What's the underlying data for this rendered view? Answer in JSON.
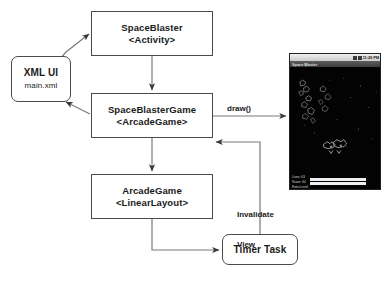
{
  "diagram": {
    "nodes": [
      {
        "id": "spaceblaster",
        "line1": "SpaceBlaster",
        "line2": "<Activity>",
        "shape": "rect"
      },
      {
        "id": "xmlui",
        "line1": "XML UI",
        "line2": "main.xml",
        "shape": "rounded-rect"
      },
      {
        "id": "game",
        "line1": "SpaceBlasterGame",
        "line2": "<ArcadeGame>",
        "shape": "rect"
      },
      {
        "id": "arcade",
        "line1": "ArcadeGame",
        "line2": "<LinearLayout>",
        "shape": "rect"
      },
      {
        "id": "timer",
        "line1": "Timer Task",
        "line2": "",
        "shape": "rounded-rect"
      }
    ],
    "edge_labels": {
      "draw": "draw()",
      "invalidate_line1": "Invalidate",
      "invalidate_line2": "View"
    },
    "colors": {
      "stroke": "#4a4a4a",
      "text": "#1a1a1a",
      "background": "#ffffff"
    }
  },
  "phone": {
    "status_bar": {
      "time": "11:29 PM"
    },
    "title_bar": {
      "title": "Space Blaster"
    },
    "hud": {
      "lines": [
        "Lives: 03",
        "Score: 00",
        "Extra Level"
      ],
      "bars": 2
    },
    "canvas": {
      "background": "#030303"
    }
  }
}
